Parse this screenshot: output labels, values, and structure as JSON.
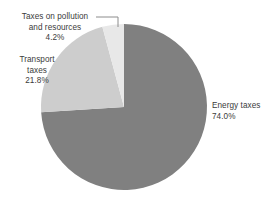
{
  "chart_data": {
    "type": "pie",
    "title": "",
    "subtitle": "",
    "xlabel": "",
    "ylabel": "",
    "legend_position": "none",
    "grid": false,
    "start_angle_deg": 0,
    "direction": "clockwise",
    "categories": [
      "Energy taxes",
      "Transport taxes",
      "Taxes on pollution and resources"
    ],
    "values": [
      74.0,
      21.8,
      4.2
    ],
    "value_suffix": "%",
    "slices": [
      {
        "name": "Energy taxes",
        "value": 74.0,
        "value_label": "74.0%",
        "color": "#808080",
        "label_lines": [
          "Energy taxes"
        ],
        "has_leader_line": false
      },
      {
        "name": "Transport taxes",
        "value": 21.8,
        "value_label": "21.8%",
        "color": "#cdcdcd",
        "label_lines": [
          "Transport",
          "taxes"
        ],
        "has_leader_line": false
      },
      {
        "name": "Taxes on pollution and resources",
        "value": 4.2,
        "value_label": "4.2%",
        "color": "#e8e8e8",
        "label_lines": [
          "Taxes on pollution",
          "and resources"
        ],
        "has_leader_line": true
      }
    ]
  },
  "labels": {
    "pollution": {
      "line1": "Taxes on pollution",
      "line2": "and resources",
      "percent": "4.2%"
    },
    "transport": {
      "line1": "Transport",
      "line2": "taxes",
      "percent": "21.8%"
    },
    "energy": {
      "line1": "Energy taxes",
      "percent": "74.0%"
    }
  },
  "colors": {
    "energy_slice": "#808080",
    "transport_slice": "#cdcdcd",
    "pollution_slice": "#e8e8e8",
    "leader_line": "#8c8c8c",
    "text": "#3b3b3b",
    "background": "#ffffff"
  }
}
